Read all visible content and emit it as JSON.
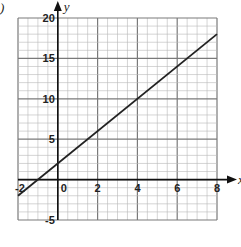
{
  "part_label": ")",
  "chart_data": {
    "type": "line",
    "title": "",
    "xlabel": "x",
    "ylabel": "y",
    "xlim": [
      -2,
      8
    ],
    "ylim": [
      -5,
      20
    ],
    "grid": true,
    "minor_grid_x_step": 0.5,
    "minor_grid_y_step": 1,
    "major_grid_x_step": 2,
    "major_grid_y_step": 5,
    "x_ticks": [
      -2,
      0,
      2,
      4,
      6,
      8
    ],
    "x_tick_labels": [
      "-2",
      "0",
      "2",
      "4",
      "6",
      "8"
    ],
    "y_ticks": [
      -5,
      5,
      10,
      15,
      20
    ],
    "y_tick_labels": [
      "-5",
      "5",
      "10",
      "15",
      "20"
    ],
    "series": [
      {
        "name": "y = 2x + 2",
        "x": [
          -2,
          8
        ],
        "y": [
          -2,
          18
        ]
      }
    ],
    "colors": {
      "grid_minor": "#b8b8b8",
      "grid_major": "#7a7a7a",
      "axis": "#111111",
      "line": "#222222"
    }
  }
}
